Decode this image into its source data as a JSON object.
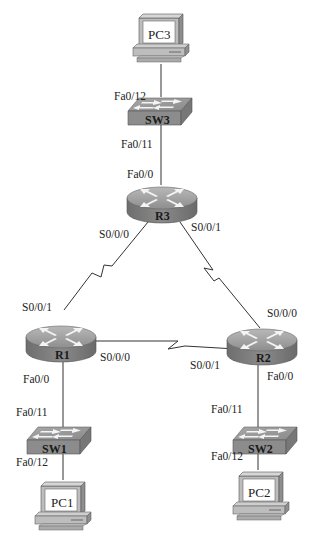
{
  "diagram": {
    "type": "network-topology",
    "devices": {
      "pc3": {
        "label": "PC3"
      },
      "sw3": {
        "label": "SW3"
      },
      "r3": {
        "label": "R3"
      },
      "r1": {
        "label": "R1"
      },
      "r2": {
        "label": "R2"
      },
      "sw1": {
        "label": "SW1"
      },
      "sw2": {
        "label": "SW2"
      },
      "pc1": {
        "label": "PC1"
      },
      "pc2": {
        "label": "PC2"
      }
    },
    "interfaces": {
      "sw3_fa012": "Fa0/12",
      "sw3_fa011": "Fa0/11",
      "r3_fa00": "Fa0/0",
      "r3_s000": "S0/0/0",
      "r3_s001": "S0/0/1",
      "r1_s001": "S0/0/1",
      "r1_s000": "S0/0/0",
      "r1_fa00": "Fa0/0",
      "r2_s000": "S0/0/0",
      "r2_s001": "S0/0/1",
      "r2_fa00": "Fa0/0",
      "sw1_fa011": "Fa0/11",
      "sw1_fa012": "Fa0/12",
      "sw2_fa011": "Fa0/11",
      "sw2_fa012": "Fa0/12"
    },
    "links": [
      {
        "from": "PC3",
        "to": "SW3 Fa0/12",
        "type": "ethernet"
      },
      {
        "from": "SW3 Fa0/11",
        "to": "R3 Fa0/0",
        "type": "ethernet"
      },
      {
        "from": "R3 S0/0/0",
        "to": "R1 S0/0/1",
        "type": "serial"
      },
      {
        "from": "R3 S0/0/1",
        "to": "R2 S0/0/0",
        "type": "serial"
      },
      {
        "from": "R1 S0/0/0",
        "to": "R2 S0/0/1",
        "type": "serial"
      },
      {
        "from": "R1 Fa0/0",
        "to": "SW1 Fa0/11",
        "type": "ethernet"
      },
      {
        "from": "SW1 Fa0/12",
        "to": "PC1",
        "type": "ethernet"
      },
      {
        "from": "R2 Fa0/0",
        "to": "SW2 Fa0/11",
        "type": "ethernet"
      },
      {
        "from": "SW2 Fa0/12",
        "to": "PC2",
        "type": "ethernet"
      }
    ]
  }
}
